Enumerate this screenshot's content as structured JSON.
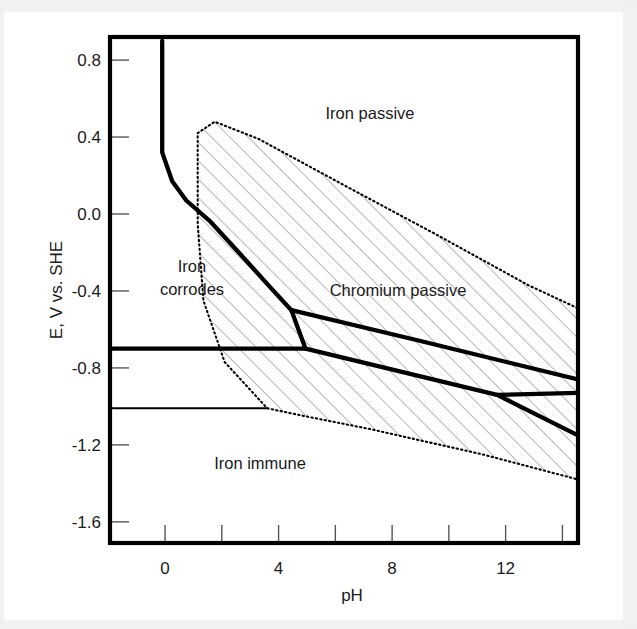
{
  "figure": {
    "kind": "pourbaix-diagram",
    "background": "#ffffff",
    "line_color": "#000000",
    "scan_band_color": "#f0f0f0"
  },
  "axes": {
    "x_label": "pH",
    "y_label": "E, V vs. SHE",
    "x_ticks_major": [
      "0",
      "4",
      "8",
      "12"
    ],
    "x_ticks_minor": [
      "2",
      "6",
      "10",
      "14"
    ],
    "y_ticks": [
      "0.8",
      "0.4",
      "0.0",
      "-0.4",
      "-0.8",
      "-1.2",
      "-1.6"
    ],
    "x_range": [
      -1.94,
      14.55
    ],
    "y_range": [
      -1.71,
      0.92
    ],
    "frame_px": {
      "left": 110,
      "top": 37,
      "right": 578,
      "bottom": 543
    }
  },
  "regions": [
    {
      "id": "iron-passive",
      "label": "Iron passive",
      "label_x_px": 370,
      "label_y_px": 113
    },
    {
      "id": "iron-corrodes",
      "label_line1": "Iron",
      "label_line2": "corrodes",
      "label_x_px": 192,
      "label_y_px": 272
    },
    {
      "id": "chromium-passive",
      "label": "Chromium passive",
      "label_x_px": 398,
      "label_y_px": 290
    },
    {
      "id": "iron-immune",
      "label": "Iron immune",
      "label_x_px": 260,
      "label_y_px": 463
    }
  ],
  "chart_data": {
    "type": "line",
    "title": "",
    "xlabel": "pH",
    "ylabel": "E, V vs. SHE",
    "xlim": [
      -1.94,
      14.55
    ],
    "ylim": [
      -1.71,
      0.92
    ],
    "grid": false,
    "legend": "none",
    "annotations": [
      {
        "text": "Iron passive",
        "pH": 7.2,
        "E": 0.53
      },
      {
        "text": "Iron corrodes",
        "pH": 0.9,
        "E": -0.31
      },
      {
        "text": "Chromium passive",
        "pH": 8.2,
        "E": -0.41
      },
      {
        "text": "Iron immune",
        "pH": 3.3,
        "E": -1.31
      }
    ],
    "series": [
      {
        "name": "Fe corrosion/passivation boundary",
        "style": "solid-thick",
        "points": [
          {
            "pH": -0.1,
            "E": 0.9
          },
          {
            "pH": -0.1,
            "E": 0.32
          },
          {
            "pH": 0.25,
            "E": 0.17
          },
          {
            "pH": 0.75,
            "E": 0.07
          },
          {
            "pH": 1.6,
            "E": -0.04
          },
          {
            "pH": 2.6,
            "E": -0.2
          },
          {
            "pH": 3.7,
            "E": -0.38
          },
          {
            "pH": 4.45,
            "E": -0.5
          },
          {
            "pH": 4.95,
            "E": -0.7
          }
        ]
      },
      {
        "name": "Cr passivation upper boundary",
        "style": "solid-thick",
        "points": [
          {
            "pH": 4.45,
            "E": -0.5
          },
          {
            "pH": 9.0,
            "E": -0.66
          },
          {
            "pH": 14.55,
            "E": -0.86
          }
        ]
      },
      {
        "name": "Water stability line (hydrogen)",
        "style": "solid-thick",
        "points": [
          {
            "pH": -1.94,
            "E": -0.7
          },
          {
            "pH": 4.95,
            "E": -0.7
          }
        ]
      },
      {
        "name": "Cr lower boundary",
        "style": "solid-thick",
        "points": [
          {
            "pH": 4.95,
            "E": -0.7
          },
          {
            "pH": 11.7,
            "E": -0.94
          },
          {
            "pH": 14.55,
            "E": -1.15
          }
        ]
      },
      {
        "name": "Cr lower branch fork",
        "style": "solid-thick",
        "points": [
          {
            "pH": 11.7,
            "E": -0.94
          },
          {
            "pH": 14.55,
            "E": -0.93
          }
        ]
      },
      {
        "name": "Iron immune boundary",
        "style": "solid-thin",
        "points": [
          {
            "pH": -1.94,
            "E": -1.01
          },
          {
            "pH": 3.6,
            "E": -1.01
          }
        ]
      },
      {
        "name": "Chromium passive region outline",
        "style": "dotted",
        "closed": true,
        "points": [
          {
            "pH": 1.15,
            "E": 0.42
          },
          {
            "pH": 1.75,
            "E": 0.48
          },
          {
            "pH": 3.3,
            "E": 0.39
          },
          {
            "pH": 6.3,
            "E": 0.15
          },
          {
            "pH": 9.6,
            "E": -0.11
          },
          {
            "pH": 12.8,
            "E": -0.37
          },
          {
            "pH": 14.55,
            "E": -0.49
          },
          {
            "pH": 14.55,
            "E": -1.38
          },
          {
            "pH": 11.2,
            "E": -1.25
          },
          {
            "pH": 7.3,
            "E": -1.12
          },
          {
            "pH": 4.9,
            "E": -1.05
          },
          {
            "pH": 3.6,
            "E": -1.01
          },
          {
            "pH": 2.1,
            "E": -0.77
          },
          {
            "pH": 1.35,
            "E": -0.45
          },
          {
            "pH": 1.15,
            "E": -0.05
          }
        ]
      }
    ]
  }
}
